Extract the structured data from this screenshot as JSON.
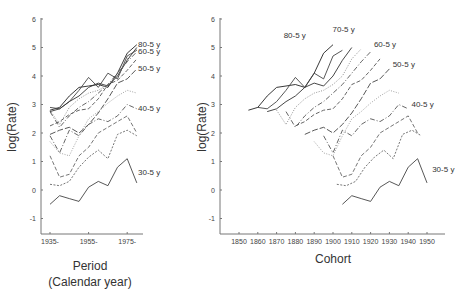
{
  "chart_data": [
    {
      "type": "line",
      "title": "",
      "xlabel": "Period\n(Calendar year)",
      "xlabel_lines": [
        "Period",
        "(Calendar year)"
      ],
      "ylabel": "log(Rate)",
      "ylim": [
        -1.6,
        6
      ],
      "xlim": [
        1932,
        1985
      ],
      "yticks": [
        -1,
        0,
        1,
        2,
        3,
        4,
        5,
        6
      ],
      "xticks": [
        "1935-",
        "1955-",
        "1975-"
      ],
      "xtick_values": [
        1935,
        1955,
        1975
      ],
      "grid": false,
      "x": [
        1935,
        1940,
        1945,
        1950,
        1955,
        1960,
        1965,
        1970,
        1975,
        1980
      ],
      "series": [
        {
          "name": "80-5 y",
          "age": 80,
          "style": "solid",
          "color": "#222222",
          "values": [
            2.8,
            2.9,
            3.3,
            3.6,
            3.65,
            3.7,
            3.6,
            4.1,
            4.8,
            5.1
          ]
        },
        {
          "name": "75-5 y",
          "age": 75,
          "style": "solid",
          "color": "#444444",
          "values": [
            2.9,
            2.85,
            3.1,
            3.5,
            3.95,
            3.6,
            4.1,
            3.9,
            4.7,
            4.9
          ]
        },
        {
          "name": "70-5 y",
          "age": 70,
          "style": "solid",
          "color": "#333333",
          "values": [
            2.75,
            2.85,
            3.1,
            3.3,
            3.6,
            3.75,
            3.65,
            4.0,
            4.55,
            5.0
          ]
        },
        {
          "name": "65-5 y",
          "age": 65,
          "style": "dotted",
          "color": "#888888",
          "values": [
            2.8,
            2.3,
            2.9,
            3.2,
            3.4,
            3.5,
            3.7,
            4.0,
            4.6,
            4.95
          ]
        },
        {
          "name": "60-5 y",
          "age": 60,
          "style": "dashdot",
          "color": "#555555",
          "values": [
            2.75,
            2.2,
            2.6,
            2.9,
            3.1,
            3.4,
            3.7,
            4.1,
            4.5,
            4.85
          ]
        },
        {
          "name": "55-5 y",
          "age": 55,
          "style": "dashed",
          "color": "#555555",
          "values": [
            2.25,
            2.4,
            2.65,
            2.8,
            2.85,
            3.2,
            3.7,
            3.85,
            4.2,
            4.6
          ]
        },
        {
          "name": "50-5 y",
          "age": 50,
          "style": "longdash",
          "color": "#444444",
          "values": [
            1.95,
            2.1,
            2.2,
            2.0,
            2.3,
            2.7,
            3.2,
            3.75,
            3.9,
            4.25
          ]
        },
        {
          "name": "45-5 y",
          "age": 45,
          "style": "dotted",
          "color": "#999999",
          "values": [
            1.7,
            1.3,
            1.2,
            1.9,
            2.5,
            2.75,
            3.05,
            3.3,
            3.5,
            3.4
          ]
        },
        {
          "name": "40-5 y",
          "age": 40,
          "style": "dashdot",
          "color": "#555555",
          "values": [
            1.9,
            1.3,
            2.1,
            1.9,
            2.3,
            2.5,
            2.4,
            2.6,
            3.0,
            2.85
          ]
        },
        {
          "name": "35-5 y",
          "age": 35,
          "style": "dashed",
          "color": "#666666",
          "values": [
            1.2,
            0.45,
            0.55,
            1.2,
            1.5,
            2.0,
            2.2,
            2.4,
            2.6,
            2.0
          ]
        },
        {
          "name": "33-5 y",
          "age": 33,
          "style": "shortdash",
          "color": "#666666",
          "values": [
            0.2,
            0.15,
            0.3,
            0.8,
            1.15,
            1.4,
            1.1,
            1.95,
            2.1,
            1.9
          ]
        },
        {
          "name": "30-5 y",
          "age": 30,
          "style": "solid",
          "color": "#444444",
          "values": [
            -0.5,
            -0.2,
            -0.3,
            -0.4,
            0.1,
            0.3,
            0.15,
            0.8,
            1.1,
            0.25
          ]
        }
      ],
      "annotations": [
        {
          "text": "80-5 y",
          "value": 5.1
        },
        {
          "text": "60-5 y",
          "value": 4.85
        },
        {
          "text": "50-5 y",
          "value": 4.25
        },
        {
          "text": "40-5 y",
          "value": 2.85
        },
        {
          "text": "30-5 y",
          "value": 0.6
        }
      ]
    },
    {
      "type": "line",
      "title": "",
      "xlabel": "Cohort",
      "ylabel": "log(Rate)",
      "ylim": [
        -1.6,
        6
      ],
      "xlim": [
        1840,
        1960
      ],
      "yticks": [
        -1,
        0,
        1,
        2,
        3,
        4,
        5,
        6
      ],
      "xticks": [
        "1850",
        "1860",
        "1870",
        "1880",
        "1890",
        "1900",
        "1910",
        "1920",
        "1930",
        "1940",
        "1950"
      ],
      "xtick_values": [
        1850,
        1860,
        1870,
        1880,
        1890,
        1900,
        1910,
        1920,
        1930,
        1940,
        1950
      ],
      "grid": false,
      "note": "cohort = period - age; same series as the period chart",
      "annotations": [
        {
          "text": "80-5 y",
          "x": 1878,
          "value": 5.4
        },
        {
          "text": "70-5 y",
          "x": 1904,
          "value": 5.6
        },
        {
          "text": "60-5 y",
          "x": 1926,
          "value": 5.1
        },
        {
          "text": "50-5 y",
          "x": 1936,
          "value": 4.4
        },
        {
          "text": "40-5 y",
          "x": 1946,
          "value": 3.0
        },
        {
          "text": "30-5 y",
          "x": 1957,
          "value": 0.7
        }
      ]
    }
  ]
}
